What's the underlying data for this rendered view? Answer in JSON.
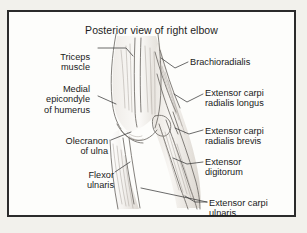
{
  "figure": {
    "title": "Posterior view of right elbow",
    "illustration_name": "posterior-elbow-anatomy-sketch",
    "style": "pencil line drawing",
    "colors": {
      "page_background": "#f2f1ec",
      "plate_background": "#fdfdfb",
      "frame_border": "#2b2b2b",
      "text": "#1a1a1a",
      "line_art": "#6e6a66",
      "shading": "#b9b4ae"
    }
  },
  "labels": {
    "left": [
      {
        "id": "triceps",
        "text": "Triceps\nmuscle"
      },
      {
        "id": "medial",
        "text": "Medial\nepicondyle\nof humerus"
      },
      {
        "id": "olecranon",
        "text": "Olecranon\nof ulna"
      },
      {
        "id": "flexor",
        "text": "Flexor\nulnaris"
      }
    ],
    "right": [
      {
        "id": "brachioradialis",
        "text": "Brachioradialis"
      },
      {
        "id": "ecrl",
        "text": "Extensor carpi\nradialis longus"
      },
      {
        "id": "ecrb",
        "text": "Extensor carpi\nradialis brevis"
      },
      {
        "id": "extdig",
        "text": "Extensor\ndigitorum"
      },
      {
        "id": "ecu",
        "text": "Extensor carpi\nulnaris"
      }
    ]
  }
}
